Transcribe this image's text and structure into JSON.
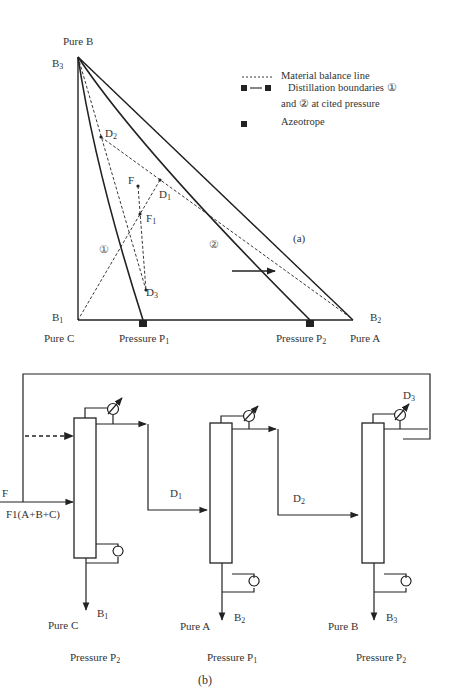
{
  "panel_a": {
    "caption": "(a)",
    "vertices": {
      "top": {
        "name": "Pure B",
        "stream": "B",
        "sub": "3"
      },
      "bottom_left": {
        "name": "Pure C",
        "stream": "B",
        "sub": "1"
      },
      "bottom_right": {
        "name": "Pure A",
        "stream": "B",
        "sub": "2"
      }
    },
    "azeotropes": [
      {
        "label": "Pressure P",
        "sub": "1"
      },
      {
        "label": "Pressure P",
        "sub": "2"
      }
    ],
    "points": [
      {
        "label": "D",
        "sub": "2"
      },
      {
        "label": "F",
        "sub": ""
      },
      {
        "label": "D",
        "sub": "1"
      },
      {
        "label": "F",
        "sub": "1"
      },
      {
        "label": "D",
        "sub": "3"
      }
    ],
    "boundary_labels": [
      "①",
      "②"
    ],
    "legend": {
      "material_balance": "Material balance line",
      "distillation_line1": "Distillation  boundaries  ①",
      "distillation_line2": "and  ②  at cited pressure",
      "azeotrope": "Azeotrope"
    }
  },
  "panel_b": {
    "caption": "(b)",
    "feed": "F",
    "feed_composition": "F1(A+B+C)",
    "streams": [
      {
        "label": "D",
        "sub": "1"
      },
      {
        "label": "D",
        "sub": "2"
      },
      {
        "label": "D",
        "sub": "3"
      }
    ],
    "columns": [
      {
        "product": "Pure C",
        "bottoms": "B",
        "sub": "1",
        "pressure": "Pressure P",
        "psub": "2"
      },
      {
        "product": "Pure A",
        "bottoms": "B",
        "sub": "2",
        "pressure": "Pressure P",
        "psub": "1"
      },
      {
        "product": "Pure B",
        "bottoms": "B",
        "sub": "3",
        "pressure": "Pressure P",
        "psub": "2"
      }
    ]
  }
}
